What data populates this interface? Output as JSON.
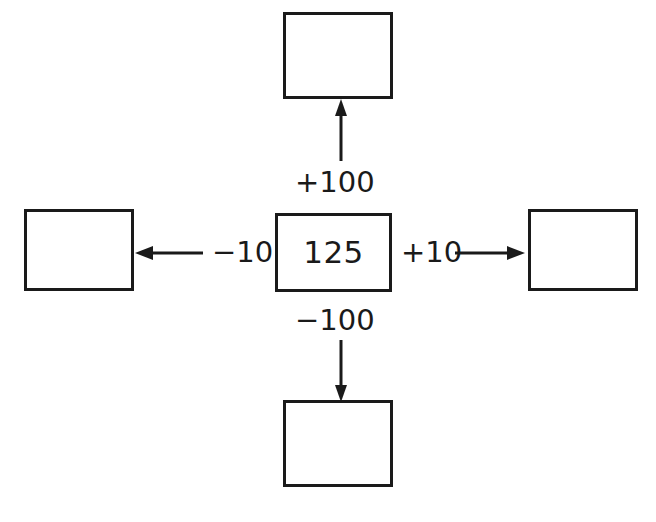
{
  "diagram": {
    "center": {
      "value": "125",
      "name": "center-number"
    },
    "branches": [
      {
        "id": "up",
        "label": "+100",
        "direction": "up",
        "arrow_points_to": "top-box",
        "target_value": ""
      },
      {
        "id": "right",
        "label": "+10",
        "direction": "right",
        "arrow_points_to": "right-box",
        "target_value": ""
      },
      {
        "id": "down",
        "label": "−100",
        "direction": "down",
        "arrow_points_to": "bottom-box",
        "target_value": ""
      },
      {
        "id": "left",
        "label": "−10",
        "direction": "left",
        "arrow_points_to": "left-box",
        "target_value": ""
      }
    ],
    "colors": {
      "stroke": "#1a1a1a",
      "background": "#ffffff",
      "text": "#1a1a1a"
    }
  }
}
